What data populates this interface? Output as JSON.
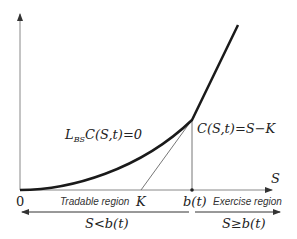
{
  "diagram": {
    "axis": {
      "x_label": "S",
      "origin_label": "0"
    },
    "ticks": {
      "strike_label": "K",
      "boundary_label": "b(t)"
    },
    "equations": {
      "pde_prefix": "L",
      "pde_subscript": "BS",
      "pde_rest": "C(S,t)=0",
      "payoff": "C(S,t)=S−K"
    },
    "regions": {
      "tradable": {
        "label": "Tradable region",
        "condition": "S<b(t)"
      },
      "exercise": {
        "label": "Exercise region",
        "condition": "S≥b(t)"
      }
    },
    "colors": {
      "curve": "#1a1a1a",
      "axis": "#555555",
      "tangent": "#777777"
    }
  }
}
